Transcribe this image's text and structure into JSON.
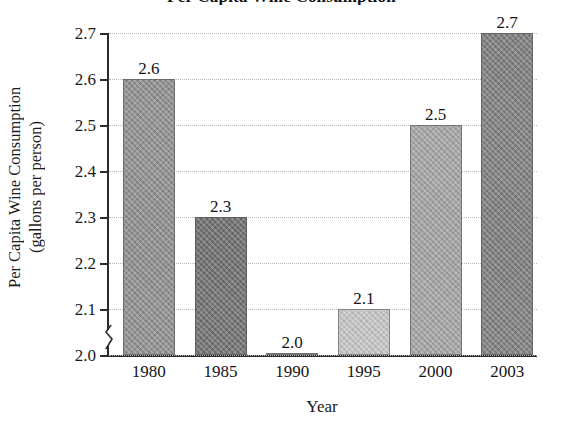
{
  "chart_data": {
    "type": "bar",
    "title": "Per Capita Wine Consumption",
    "xlabel": "Year",
    "ylabel": "Per Capita Wine Consumption",
    "ylabel_units": "(gallons per person)",
    "categories": [
      "1980",
      "1985",
      "1990",
      "1995",
      "2000",
      "2003"
    ],
    "values": [
      2.6,
      2.3,
      2.0,
      2.1,
      2.5,
      2.7
    ],
    "value_labels": [
      "2.6",
      "2.3",
      "2.0",
      "2.1",
      "2.5",
      "2.7"
    ],
    "ylim": [
      2.0,
      2.7
    ],
    "yticks": [
      2.0,
      2.1,
      2.2,
      2.3,
      2.4,
      2.5,
      2.6,
      2.7
    ],
    "ytick_labels": [
      "2.0",
      "2.1",
      "2.2",
      "2.3",
      "2.4",
      "2.5",
      "2.6",
      "2.7"
    ],
    "axis_break": true,
    "grid": true,
    "grid_style": "dotted",
    "legend": "none",
    "bar_colors": [
      "#8e8e8e",
      "#6e6e6e",
      "#9a9a9a",
      "#c4c4c4",
      "#a3a3a3",
      "#7d7d7d"
    ],
    "axis_color": "#2b2b2b",
    "grid_color": "#b9b9b9",
    "background": "#ffffff"
  }
}
